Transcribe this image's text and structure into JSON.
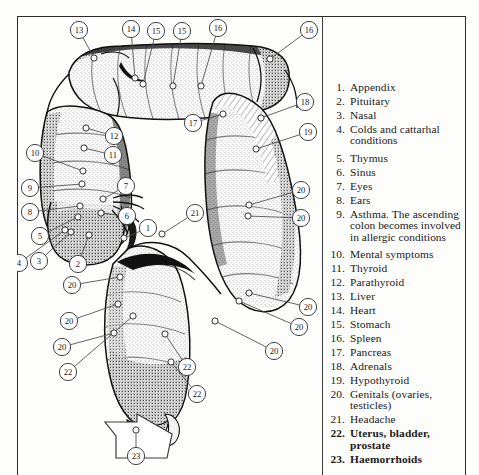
{
  "figure": {
    "kind": "anatomical-reflex-diagram",
    "ink_color": "#1a1a1a",
    "paper_color": "#fdfdfc"
  },
  "legend": {
    "items": [
      {
        "num": "1.",
        "text": "Appendix"
      },
      {
        "num": "2.",
        "text": "Pituitary"
      },
      {
        "num": "3.",
        "text": "Nasal"
      },
      {
        "num": "4.",
        "text": "Colds and cattarhal",
        "cont": "conditions"
      },
      {
        "num": "5.",
        "text": "Thymus"
      },
      {
        "num": "6.",
        "text": "Sinus"
      },
      {
        "num": "7.",
        "text": "Eyes"
      },
      {
        "num": "8.",
        "text": "Ears"
      },
      {
        "num": "9.",
        "text": "Asthma. The ascending",
        "cont": "colon becomes  involved",
        "cont2": "in allergic conditions"
      },
      {
        "num": "10.",
        "text": "Mental symptoms"
      },
      {
        "num": "11.",
        "text": "Thyroid"
      },
      {
        "num": "12.",
        "text": "Parathyroid"
      },
      {
        "num": "13.",
        "text": "Liver"
      },
      {
        "num": "14.",
        "text": "Heart"
      },
      {
        "num": "15.",
        "text": "Stomach"
      },
      {
        "num": "16.",
        "text": "Spleen"
      },
      {
        "num": "17.",
        "text": "Pancreas"
      },
      {
        "num": "18.",
        "text": "Adrenals"
      },
      {
        "num": "19.",
        "text": "Hypothyroid"
      },
      {
        "num": "20.",
        "text": "Genitals (ovaries, testicles)"
      },
      {
        "num": "21.",
        "text": "Headache"
      },
      {
        "num": "22.",
        "text": "Uterus, bladder, prostate",
        "bold": true
      },
      {
        "num": "23.",
        "text": "Haemorrhoids",
        "bold": true
      }
    ]
  },
  "callouts": [
    {
      "label": "13",
      "cx": 62,
      "cy": 14,
      "tx": 77,
      "ty": 42
    },
    {
      "label": "14",
      "cx": 114,
      "cy": 13,
      "tx": 118,
      "ty": 62
    },
    {
      "label": "15",
      "cx": 139,
      "cy": 15,
      "tx": 126,
      "ty": 68
    },
    {
      "label": "15",
      "cx": 165,
      "cy": 15,
      "tx": 156,
      "ty": 70
    },
    {
      "label": "16",
      "cx": 201,
      "cy": 12,
      "tx": 184,
      "ty": 70
    },
    {
      "label": "16",
      "cx": 292,
      "cy": 14,
      "tx": 253,
      "ty": 43
    },
    {
      "label": "18",
      "cx": 288,
      "cy": 86,
      "tx": 244,
      "ty": 102
    },
    {
      "label": "17",
      "cx": 176,
      "cy": 107,
      "tx": 206,
      "ty": 98
    },
    {
      "label": "19",
      "cx": 291,
      "cy": 116,
      "tx": 239,
      "ty": 133
    },
    {
      "label": "12",
      "cx": 97,
      "cy": 120,
      "tx": 69,
      "ty": 112
    },
    {
      "label": "11",
      "cx": 96,
      "cy": 139,
      "tx": 67,
      "ty": 132
    },
    {
      "label": "10",
      "cx": 18,
      "cy": 137,
      "tx": 66,
      "ty": 155
    },
    {
      "label": "9",
      "cx": 13,
      "cy": 172,
      "tx": 65,
      "ty": 168
    },
    {
      "label": "7",
      "cx": 109,
      "cy": 170,
      "tx": 86,
      "ty": 183
    },
    {
      "label": "8",
      "cx": 13,
      "cy": 196,
      "tx": 63,
      "ty": 190
    },
    {
      "label": "6",
      "cx": 110,
      "cy": 200,
      "tx": 84,
      "ty": 197
    },
    {
      "label": "5",
      "cx": 23,
      "cy": 220,
      "tx": 61,
      "ty": 201
    },
    {
      "label": "1",
      "cx": 131,
      "cy": 212,
      "tx": 107,
      "ty": 222
    },
    {
      "label": "3",
      "cx": 22,
      "cy": 245,
      "tx": 54,
      "ty": 216
    },
    {
      "label": "4",
      "cx": 2,
      "cy": 247,
      "tx": 48,
      "ty": 214
    },
    {
      "label": "2",
      "cx": 61,
      "cy": 248,
      "tx": 72,
      "ty": 219
    },
    {
      "label": "20",
      "cx": 284,
      "cy": 174,
      "tx": 232,
      "ty": 189
    },
    {
      "label": "20",
      "cx": 284,
      "cy": 202,
      "tx": 231,
      "ty": 200
    },
    {
      "label": "21",
      "cx": 178,
      "cy": 197,
      "tx": 145,
      "ty": 218
    },
    {
      "label": "20",
      "cx": 291,
      "cy": 291,
      "tx": 232,
      "ty": 277
    },
    {
      "label": "20",
      "cx": 282,
      "cy": 311,
      "tx": 222,
      "ty": 285
    },
    {
      "label": "20",
      "cx": 257,
      "cy": 335,
      "tx": 198,
      "ty": 305
    },
    {
      "label": "20",
      "cx": 55,
      "cy": 269,
      "tx": 103,
      "ty": 261
    },
    {
      "label": "20",
      "cx": 52,
      "cy": 305,
      "tx": 101,
      "ty": 288
    },
    {
      "label": "20",
      "cx": 45,
      "cy": 331,
      "tx": 97,
      "ty": 317
    },
    {
      "label": "22",
      "cx": 51,
      "cy": 356,
      "tx": 116,
      "ty": 300
    },
    {
      "label": "22",
      "cx": 170,
      "cy": 351,
      "tx": 148,
      "ty": 318
    },
    {
      "label": "22",
      "cx": 180,
      "cy": 378,
      "tx": 154,
      "ty": 346
    },
    {
      "label": "23",
      "cx": 119,
      "cy": 440,
      "tx": 119,
      "ty": 414
    }
  ]
}
